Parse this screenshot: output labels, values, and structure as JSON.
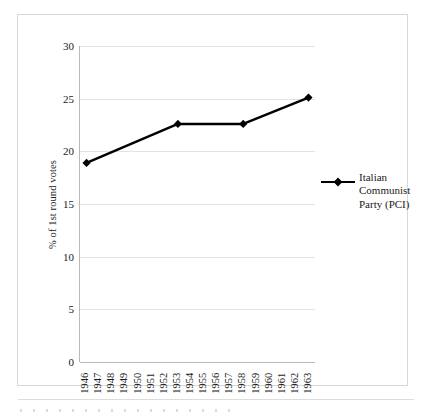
{
  "chart_data": {
    "type": "line",
    "title": "",
    "subtitle": "",
    "xlabel": "",
    "ylabel": "% of 1st round votes",
    "ylim": [
      0,
      30
    ],
    "ytick_step": 5,
    "yticks": [
      "0",
      "5",
      "10",
      "15",
      "20",
      "25",
      "30"
    ],
    "categories": [
      "1946",
      "1947",
      "1948",
      "1949",
      "1950",
      "1951",
      "1952",
      "1953",
      "1954",
      "1955",
      "1956",
      "1957",
      "1958",
      "1959",
      "1960",
      "1961",
      "1962",
      "1963"
    ],
    "grid": "horizontal",
    "legend_position": "right",
    "series": [
      {
        "name": "Italian Communist Party (PCI)",
        "marker": "diamond",
        "color": "#000000",
        "x": [
          "1946",
          "1953",
          "1958",
          "1963"
        ],
        "values": [
          18.9,
          22.6,
          22.6,
          25.1
        ]
      }
    ],
    "annotations": []
  },
  "legend": {
    "entries": [
      {
        "label": "Italian Communist Party (PCI)",
        "marker": "diamond-line-marker"
      }
    ]
  },
  "axis": {
    "y_title": "% of 1st round votes"
  }
}
